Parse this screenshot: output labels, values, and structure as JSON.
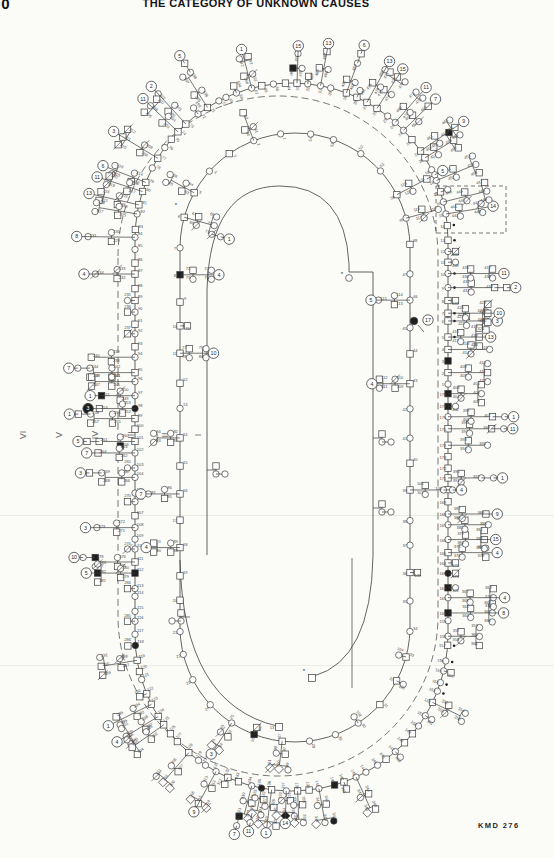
{
  "page": {
    "number": "00",
    "header": "THE CATEGORY OF UNKNOWN CAUSES",
    "figure_id": "KMD 276"
  },
  "generation_axis": {
    "labels": [
      "VI",
      "V",
      "IV",
      "III",
      "II",
      "I"
    ],
    "x_positions": [
      25,
      62,
      97,
      133,
      168,
      203
    ],
    "y": 438
  },
  "colors": {
    "paper": "#fbfbf8",
    "ink": "#1f1f1f",
    "line": "#3d3d3d",
    "label": "#4a4a4a",
    "muted": "#6d6d6d",
    "artifact": "#ecece7"
  },
  "diagram": {
    "type": "pedigree-spiral",
    "seed": 11,
    "canvas": {
      "w": 554,
      "h": 858
    },
    "rings": [
      {
        "id": "outer",
        "style": "solid",
        "L": 135,
        "R": 448,
        "T": 83,
        "B": 791,
        "symbols": 148,
        "chain_rate": 0.45,
        "pair_rate": 0.35,
        "label_start": 64,
        "label_mod": 178,
        "chain_label_start": 190,
        "side": "out"
      },
      {
        "id": "outer-dashed",
        "style": "dashed",
        "L": 118,
        "R": 438,
        "T": 96,
        "B": 776,
        "symbols": 0
      },
      {
        "id": "turn2",
        "style": "solid",
        "L": 180,
        "R": 410,
        "T": 133,
        "B": 742,
        "symbols": 54,
        "chain_rate": 0.3,
        "pair_rate": 0.2,
        "label_start": 1,
        "label_mod": 178,
        "chain_label_start": 60,
        "side": "mixed"
      }
    ],
    "inner_paths": [
      {
        "id": "hook-turn2",
        "d": "M 180 560 Q 183 704 277 726"
      },
      {
        "id": "turn3",
        "d": "M 207 555 L 207 290 Q 210 186 280 186 Q 345 186 349 264 L 349 272 L 373 272 L 373 556 Q 371 660 314 676"
      }
    ],
    "terminals": [
      {
        "x": 349,
        "y": 278,
        "kind": "circle",
        "label": ""
      },
      {
        "x": 312,
        "y": 678,
        "kind": "square",
        "label": ""
      },
      {
        "x": 279,
        "y": 727,
        "kind": "square",
        "label": "13"
      }
    ],
    "asterisks": [
      [
        342,
        276
      ],
      [
        304,
        673
      ],
      [
        176,
        207
      ]
    ],
    "proband": {
      "x": 414,
      "y": 321,
      "circled": "17"
    },
    "dot_runs": [
      {
        "x_min": 438,
        "y_min": 220,
        "y_max": 340
      },
      {
        "x_min": 428,
        "y_min": 645,
        "y_max": 702
      }
    ],
    "dashed_rect": {
      "x": 436,
      "y": 186,
      "w": 70,
      "h": 47
    },
    "spurs": [
      [
        373,
        438,
        1
      ],
      [
        373,
        508,
        1
      ],
      [
        190,
        617,
        -1
      ],
      [
        207,
        470,
        1
      ]
    ],
    "connectors": [
      [
        352,
        558,
        352,
        688
      ]
    ],
    "observed_labels": {
      "ring_left": [
        "97",
        "98",
        "99",
        "100",
        "101",
        "102",
        "103",
        "104",
        "105",
        "106"
      ],
      "ring_bottom_left": [
        "110",
        "111",
        "112",
        "113",
        "114",
        "115",
        "116",
        "117",
        "118"
      ],
      "ring_bottom": [
        "133",
        "134",
        "135",
        "136",
        "137",
        "138"
      ],
      "chain_left": [
        "199",
        "200",
        "201",
        "202",
        "204",
        "205",
        "207",
        "208",
        "209",
        "210",
        "211",
        "212",
        "213",
        "214",
        "215",
        "298",
        "299",
        "300",
        "301",
        "302"
      ],
      "chain_bottom": [
        "229",
        "230",
        "231",
        "232",
        "233",
        "234"
      ],
      "sibship_counts": [
        "2",
        "5",
        "8",
        "9",
        "10",
        "11",
        "12",
        "13",
        "17",
        "18",
        "25",
        "26",
        "28",
        "30"
      ]
    },
    "artifact_lines_y": [
      515,
      665
    ]
  }
}
